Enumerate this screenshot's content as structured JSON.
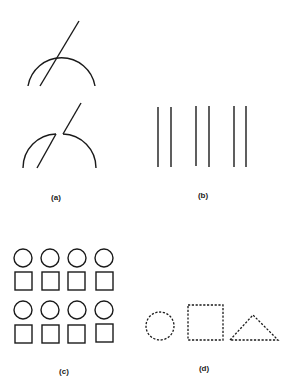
{
  "figure": {
    "panels": [
      {
        "id": "a",
        "label": "(a)",
        "description": "Line crossing semicircular arc; below, same figure with interrupted contours"
      },
      {
        "id": "b",
        "label": "(b)",
        "description": "Six vertical lines grouped in three pairs"
      },
      {
        "id": "c",
        "label": "(c)",
        "description": "Two rows of alternating circles and squares, 4 columns"
      },
      {
        "id": "d",
        "label": "(d)",
        "description": "Dashed circle, square, and triangle"
      }
    ],
    "colors": {
      "stroke": "#1a1a1a",
      "background": "#ffffff"
    }
  }
}
